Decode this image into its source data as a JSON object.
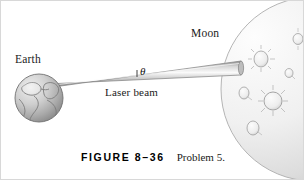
{
  "figure": {
    "type": "physics-textbook-diagram",
    "background_color": "#ffffff",
    "border_color": "#d8d8d8",
    "width": 304,
    "height": 180
  },
  "labels": {
    "earth": "Earth",
    "moon": "Moon",
    "laser_beam": "Laser beam",
    "angle_theta": "θ"
  },
  "caption": {
    "figure_label": "FIGURE 8–36",
    "problem_text": "Problem 5."
  },
  "objects": {
    "earth": {
      "name": "earth-sphere",
      "center_x": 38,
      "center_y": 97,
      "radius": 24,
      "fill_light": "#e8e8e8",
      "fill_dark": "#8f8f8f",
      "outline_color": "#6f6f6f"
    },
    "moon": {
      "name": "moon-sphere",
      "center_x": 312,
      "center_y": 88,
      "radius": 92,
      "fill_light": "#fbfbfb",
      "fill_dark": "#d2d2d2",
      "outline_color": "#a8a8a8",
      "craters": [
        {
          "cx": 260,
          "cy": 58,
          "rx": 7,
          "ry": 8,
          "rays": true
        },
        {
          "cx": 288,
          "cy": 72,
          "rx": 4,
          "ry": 4.5,
          "rays": false
        },
        {
          "cx": 243,
          "cy": 92,
          "rx": 5,
          "ry": 6,
          "rays": false
        },
        {
          "cx": 272,
          "cy": 100,
          "rx": 9,
          "ry": 9,
          "rays": true
        },
        {
          "cx": 252,
          "cy": 127,
          "rx": 6,
          "ry": 7,
          "rays": false
        },
        {
          "cx": 297,
          "cy": 38,
          "rx": 5,
          "ry": 5.5,
          "rays": true
        }
      ]
    },
    "laser_beam": {
      "name": "laser-beam-cone",
      "apex_x": 56,
      "apex_y": 84,
      "end_x": 240,
      "end_y": 67,
      "half_width_start": 1.5,
      "half_width_end": 7,
      "fill_light": "#f2f2f2",
      "fill_dark": "#9a9a9a",
      "outline_color": "#7d7d7d"
    },
    "angle_marker": {
      "name": "angle-tick-mark",
      "x": 136,
      "y": 70
    }
  }
}
